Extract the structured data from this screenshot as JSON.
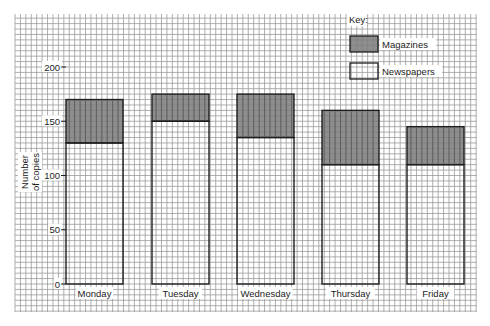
{
  "chart_data": {
    "type": "bar",
    "stacked": true,
    "title": "",
    "xlabel": "",
    "ylabel": "Number of copies",
    "ylabel_lines": [
      "Number",
      "of copies"
    ],
    "ylim": [
      0,
      200
    ],
    "yticks": [
      0,
      50,
      100,
      150,
      200
    ],
    "grid": true,
    "categories": [
      "Monday",
      "Tuesday",
      "Wednesday",
      "Thursday",
      "Friday"
    ],
    "series": [
      {
        "name": "Newspapers",
        "values": [
          130,
          150,
          135,
          110,
          110
        ],
        "color": "#ffffff"
      },
      {
        "name": "Magazines",
        "values": [
          40,
          25,
          40,
          50,
          35
        ],
        "color": "#7a7a7a"
      }
    ],
    "totals": [
      170,
      175,
      175,
      160,
      145
    ],
    "legend": {
      "title": "Key:",
      "position": "top-right",
      "entries": [
        {
          "label": "Magazines",
          "color": "#7a7a7a"
        },
        {
          "label": "Newspapers",
          "color": "#ffffff"
        }
      ]
    }
  },
  "colors": {
    "grid": "#9a9a9a",
    "grid_paper": "#ffffff",
    "bar_outline": "#1e1e1e",
    "magazines_fill": "#7a7a7a",
    "newspapers_fill": "#ffffff"
  }
}
